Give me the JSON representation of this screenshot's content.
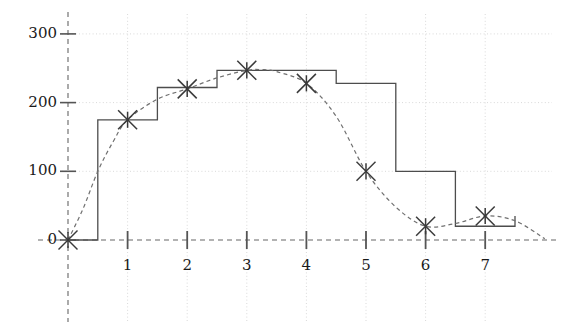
{
  "chart_data": {
    "type": "line",
    "title": "",
    "subtitle": "",
    "xlabel": "",
    "ylabel": "",
    "xlim": [
      -0.35,
      8.15
    ],
    "ylim": [
      -65,
      320
    ],
    "grid": true,
    "grid_style": "dotted",
    "legend": false,
    "legend_position": "none",
    "x_ticks": [
      1,
      2,
      3,
      4,
      5,
      6,
      7
    ],
    "x_tick_labels": [
      "1",
      "2",
      "3",
      "4",
      "5",
      "6",
      "7"
    ],
    "y_ticks": [
      0,
      100,
      200,
      300
    ],
    "y_tick_labels": [
      "0",
      "100",
      "200",
      "300"
    ],
    "series": [
      {
        "name": "histogram-step",
        "style": "step",
        "line_style": "solid",
        "color": "#4d4d4d",
        "x": [
          0,
          0.5,
          1.5,
          2.5,
          4.5,
          5.5,
          6.5,
          7.5
        ],
        "values": [
          0,
          175,
          222,
          247,
          228,
          100,
          20,
          35
        ],
        "step_edges": [
          0,
          0.5,
          1.5,
          2.5,
          4.5,
          5.5,
          6.5,
          7.5
        ],
        "step_heights": [
          0,
          175,
          222,
          247,
          228,
          100,
          20,
          35
        ]
      },
      {
        "name": "smooth-density-curve",
        "style": "line",
        "line_style": "dashed",
        "color": "#707070",
        "x": [
          0,
          0.25,
          0.5,
          0.75,
          1,
          1.5,
          2,
          2.5,
          3,
          3.25,
          3.5,
          4,
          4.5,
          5,
          5.5,
          6,
          6.5,
          7,
          7.5,
          8
        ],
        "values": [
          0,
          45,
          100,
          142,
          175,
          205,
          220,
          236,
          247,
          248,
          245,
          228,
          180,
          100,
          48,
          20,
          24,
          35,
          28,
          2
        ]
      },
      {
        "name": "data-point-markers",
        "style": "scatter",
        "marker": "x-asterisk",
        "color": "#3a3a3a",
        "x": [
          0,
          1,
          2,
          3,
          4,
          5,
          6,
          7
        ],
        "values": [
          0,
          175,
          220,
          247,
          228,
          100,
          20,
          35
        ]
      }
    ],
    "axes": {
      "y_axis_x": 0,
      "y_axis_style": "dashed",
      "x_axis_y": 0,
      "x_axis_style": "dashed",
      "axis_color": "#555555"
    }
  },
  "ticks": {
    "y": [
      {
        "label": "300",
        "value": 300
      },
      {
        "label": "200",
        "value": 200
      },
      {
        "label": "100",
        "value": 100
      },
      {
        "label": "0",
        "value": 0
      }
    ],
    "x": [
      {
        "label": "1",
        "value": 1
      },
      {
        "label": "2",
        "value": 2
      },
      {
        "label": "3",
        "value": 3
      },
      {
        "label": "4",
        "value": 4
      },
      {
        "label": "5",
        "value": 5
      },
      {
        "label": "6",
        "value": 6
      },
      {
        "label": "7",
        "value": 7
      }
    ]
  },
  "colors": {
    "background": "#ffffff",
    "step_line": "#4d4d4d",
    "curve_line": "#707070",
    "grid": "#d9d9d9",
    "axis": "#555555",
    "text": "#1a1a1a",
    "marker": "#3a3a3a"
  }
}
